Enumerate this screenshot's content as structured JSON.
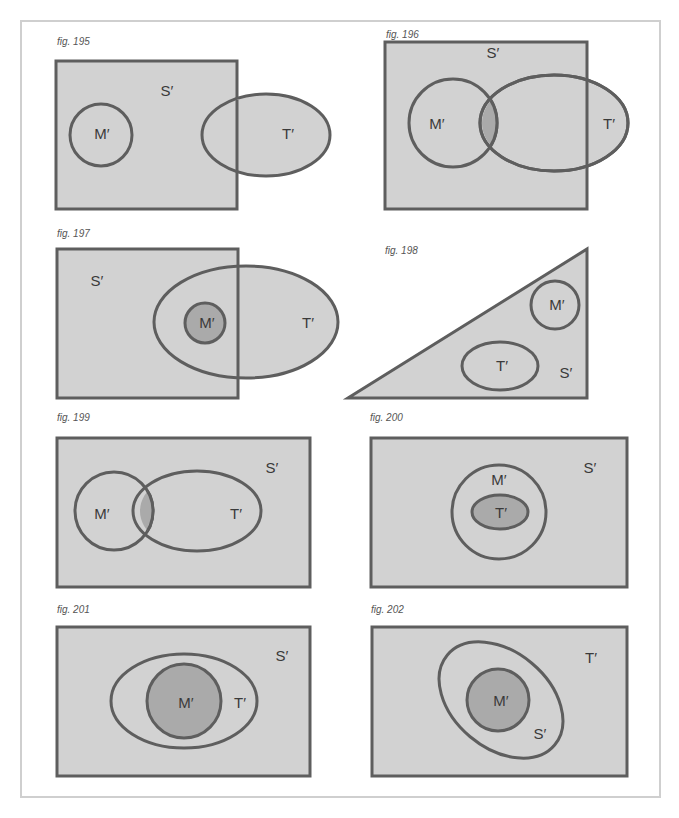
{
  "colors": {
    "fill": "#d2d2d2",
    "dark_fill": "#aaaaaa",
    "stroke": "#5e5e5e",
    "frame": "#cfcfcf",
    "caption": "#555555"
  },
  "figures": [
    {
      "caption": "fig. 195",
      "labels": {
        "S": "S′",
        "M": "M′",
        "T": "T′"
      }
    },
    {
      "caption": "fig. 196",
      "labels": {
        "S": "S′",
        "M": "M′",
        "T": "T′"
      }
    },
    {
      "caption": "fig. 197",
      "labels": {
        "S": "S′",
        "M": "M′",
        "T": "T′"
      }
    },
    {
      "caption": "fig. 198",
      "labels": {
        "S": "S′",
        "M": "M′",
        "T": "T′"
      }
    },
    {
      "caption": "fig. 199",
      "labels": {
        "S": "S′",
        "M": "M′",
        "T": "T′"
      }
    },
    {
      "caption": "fig. 200",
      "labels": {
        "S": "S′",
        "M": "M′",
        "T": "T′"
      }
    },
    {
      "caption": "fig. 201",
      "labels": {
        "S": "S′",
        "M": "M′",
        "T": "T′"
      }
    },
    {
      "caption": "fig. 202",
      "labels": {
        "S": "S′",
        "M": "M′",
        "T": "T′"
      }
    }
  ]
}
